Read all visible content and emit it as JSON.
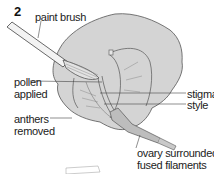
{
  "figure": {
    "step_number": "2",
    "labels": {
      "paint_brush": "paint brush",
      "pollen_applied_1": "pollen",
      "pollen_applied_2": "applied",
      "anthers_removed_1": "anthers",
      "anthers_removed_2": "removed",
      "stigma": "stigma",
      "style": "style",
      "ovary_1": "ovary surrounded by",
      "ovary_2": "fused filaments"
    },
    "colors": {
      "petal_fill": "#d4d4d4",
      "line": "#444444",
      "text": "#222222"
    }
  }
}
